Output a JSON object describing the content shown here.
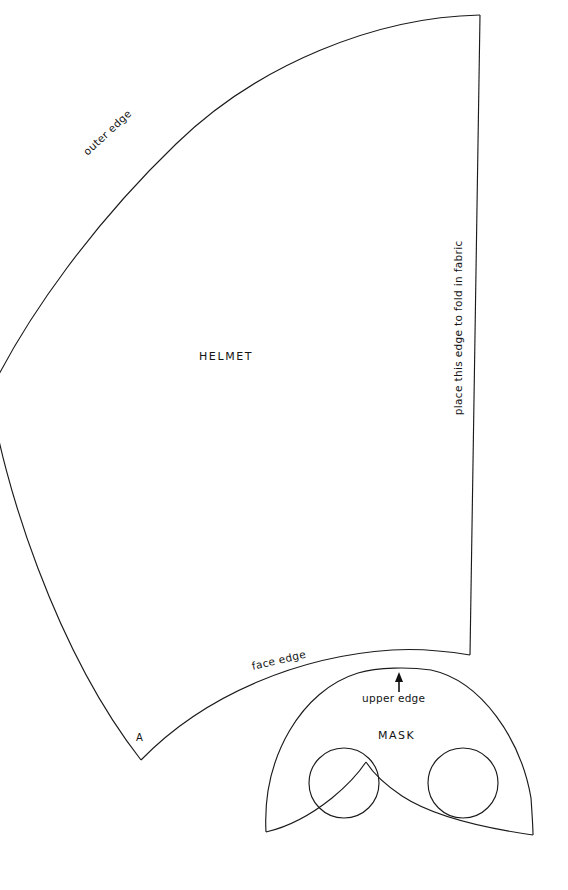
{
  "page": {
    "background_color": "#ffffff",
    "ink_color": "#1b1b1b",
    "width": 568,
    "height": 890
  },
  "pieces": {
    "helmet": {
      "name": "HELMET",
      "labels": {
        "outer_edge": "outer edge",
        "face_edge": "face edge",
        "fold_edge": "place this edge to fold in fabric",
        "vertex_a": "A"
      }
    },
    "mask": {
      "name": "MASK",
      "labels": {
        "upper_edge": "upper edge"
      },
      "eye_holes": [
        {
          "cx": 344,
          "cy": 783,
          "r": 35
        },
        {
          "cx": 463,
          "cy": 783,
          "r": 35
        }
      ]
    }
  },
  "geometry": {
    "helmet_outline": "M 480 15 C 360 19 236 74 156 158 C 68 250 14 315 -14 392 C 6 499 60 650 141 760 L 470 655 C 404 636 300 634 222 663 C 199 671 170 680 141 760",
    "helmet_outer_edge": "M 480 15 C 377 17 258 64 176 144 C 95 222 28 314 -10 392",
    "helmet_left_lower_edge": "M -10 392 C 2 480 55 650 141 760",
    "helmet_face_edge": "M 141 760 C 205 694 300 656 392 650 C 424 648 452 652 470 655",
    "helmet_fold_edge": "M 480 15 L 470 655",
    "mask_outline": "M 266 832 C 262 760 300 690 356 672 C 376 666 410 666 430 668 C 481 678 521 738 531 797 C 532 812 533 826 533 835 C 480 826 430 816 398 794 C 381 782 372 772 366 762 C 358 774 344 788 326 800 C 304 814 284 826 266 832 Z",
    "mask_top_arc": "M 266 832 C 262 757 302 690 358 673 C 378 667 410 667 431 670 C 482 681 521 740 531 798 C 532 813 533 827 533 835",
    "mask_bottom_left": "M 266 832 C 288 827 312 814 332 798 C 348 785 358 774 366 762",
    "mask_bottom_right": "M 366 762 C 373 773 384 784 402 796 C 434 817 484 828 533 835",
    "arrow": {
      "x": 399,
      "y_top": 676,
      "y_bottom": 692
    }
  }
}
